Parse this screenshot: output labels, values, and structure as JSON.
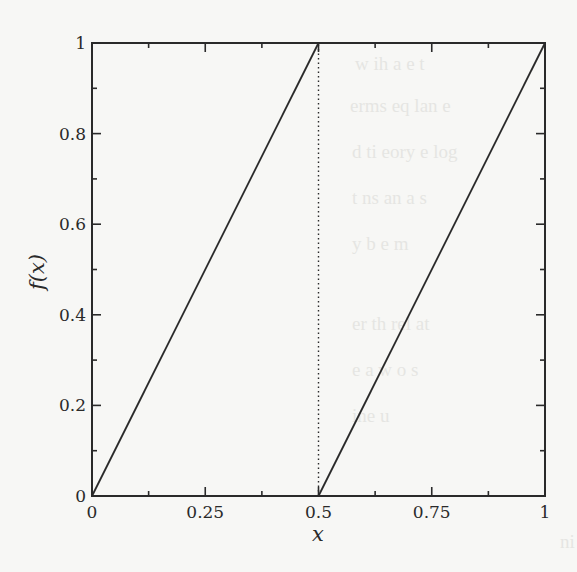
{
  "chart_data": {
    "type": "line",
    "title": "",
    "xlabel": "x",
    "ylabel": "f(x)",
    "xlim": [
      0,
      1
    ],
    "ylim": [
      0,
      1
    ],
    "grid": false,
    "legend": null,
    "x_ticks": [
      0,
      0.25,
      0.5,
      0.75,
      1
    ],
    "x_tick_labels": [
      "0",
      "0.25",
      "0.5",
      "0.75",
      "1"
    ],
    "x_minor_ticks": [
      0.125,
      0.375,
      0.625,
      0.875
    ],
    "y_ticks": [
      0,
      0.2,
      0.4,
      0.6,
      0.8,
      1
    ],
    "y_tick_labels": [
      "0",
      "0.2",
      "0.4",
      "0.6",
      "0.8",
      "1"
    ],
    "y_minor_ticks": [
      0.1,
      0.3,
      0.5,
      0.7,
      0.9
    ],
    "series": [
      {
        "name": "f(x) = 2x mod 1 (branch 1)",
        "style": "solid",
        "x": [
          0,
          0.5
        ],
        "y": [
          0,
          1
        ]
      },
      {
        "name": "f(x) = 2x mod 1 (branch 2)",
        "style": "solid",
        "x": [
          0.5,
          1
        ],
        "y": [
          0,
          1
        ]
      }
    ],
    "annotations": [
      {
        "type": "vertical-line",
        "x": 0.5,
        "style": "dotted",
        "from_y": 0,
        "to_y": 1
      }
    ]
  },
  "frame": {
    "left": 92,
    "right": 545,
    "top": 43,
    "bottom": 496,
    "line_color": "#2a2a2a"
  }
}
